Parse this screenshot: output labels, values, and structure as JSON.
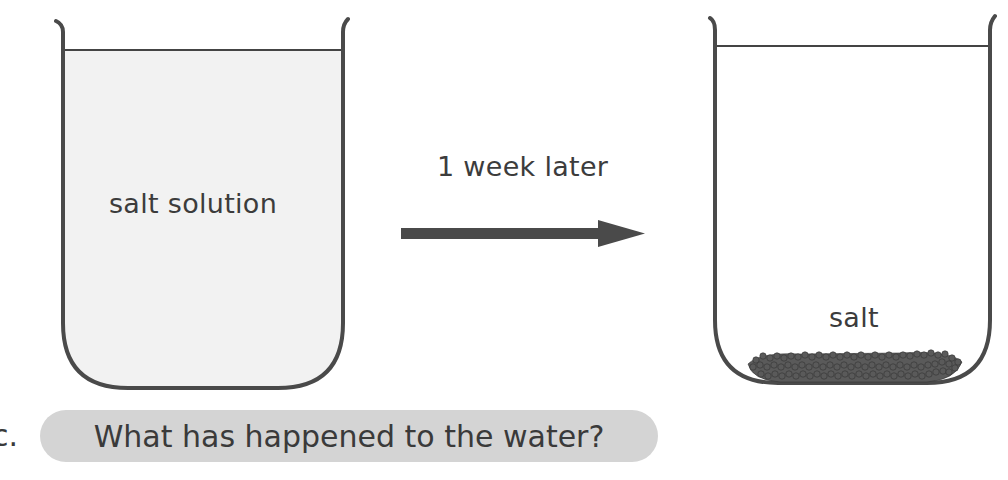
{
  "diagram": {
    "beaker_before": {
      "label": "salt solution",
      "liquid_fill": "#f2f2f2"
    },
    "transition": {
      "label": "1 week later",
      "arrow_color": "#4a4a4a"
    },
    "beaker_after": {
      "label": "salt",
      "residue_color": "#555555"
    }
  },
  "question": {
    "letter": "c.",
    "text": "What has happened to the water?",
    "pill_color": "#d4d4d4"
  }
}
